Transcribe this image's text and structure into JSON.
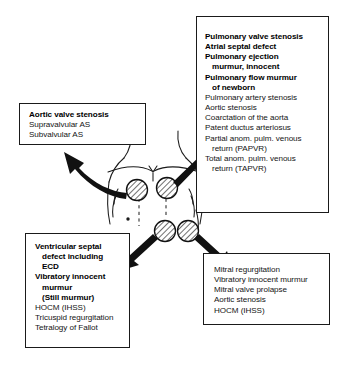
{
  "diagram": {
    "figure_name": "chest-auscultation-diagram"
  },
  "boxes": {
    "pulmonary": {
      "name": "pulmonary-area-box",
      "lines": [
        {
          "text": "Pulmonary valve stenosis",
          "bold": true,
          "indent": false
        },
        {
          "text": "Atrial septal defect",
          "bold": true,
          "indent": false
        },
        {
          "text": "Pulmonary ejection",
          "bold": true,
          "indent": false
        },
        {
          "text": "murmur, innocent",
          "bold": true,
          "indent": true
        },
        {
          "text": "Pulmonary flow murmur",
          "bold": true,
          "indent": false
        },
        {
          "text": "of newborn",
          "bold": true,
          "indent": true
        },
        {
          "text": "Pulmonary artery stenosis",
          "bold": false,
          "indent": false
        },
        {
          "text": "Aortic stenosis",
          "bold": false,
          "indent": false
        },
        {
          "text": "Coarctation of the aorta",
          "bold": false,
          "indent": false
        },
        {
          "text": "Patent ductus arteriosus",
          "bold": false,
          "indent": false
        },
        {
          "text": "Partial anom. pulm. venous",
          "bold": false,
          "indent": false
        },
        {
          "text": "return (PAPVR)",
          "bold": false,
          "indent": true
        },
        {
          "text": "Total anom. pulm. venous",
          "bold": false,
          "indent": false
        },
        {
          "text": "return (TAPVR)",
          "bold": false,
          "indent": true
        }
      ]
    },
    "aortic": {
      "name": "aortic-area-box",
      "lines": [
        {
          "text": "Aortic valve stenosis",
          "bold": true,
          "indent": false
        },
        {
          "text": "Supravalvular AS",
          "bold": false,
          "indent": false
        },
        {
          "text": "Subvalvular AS",
          "bold": false,
          "indent": false
        }
      ]
    },
    "vsd": {
      "name": "lower-left-sternal-border-box",
      "lines": [
        {
          "text": "Ventricular septal",
          "bold": true,
          "indent": false
        },
        {
          "text": "defect including",
          "bold": true,
          "indent": true
        },
        {
          "text": "ECD",
          "bold": true,
          "indent": true
        },
        {
          "text": "Vibratory innocent",
          "bold": true,
          "indent": false
        },
        {
          "text": "murmur",
          "bold": true,
          "indent": true
        },
        {
          "text": "(Still murmur)",
          "bold": true,
          "indent": true
        },
        {
          "text": "HOCM (IHSS)",
          "bold": false,
          "indent": false
        },
        {
          "text": "Tricuspid regurgitation",
          "bold": false,
          "indent": false
        },
        {
          "text": "Tetralogy of Fallot",
          "bold": false,
          "indent": false
        }
      ]
    },
    "mitral": {
      "name": "apex-area-box",
      "lines": [
        {
          "text": "Mitral regurgitation",
          "bold": false,
          "indent": false
        },
        {
          "text": "Vibratory innocent murmur",
          "bold": false,
          "indent": false
        },
        {
          "text": "Mitral valve prolapse",
          "bold": false,
          "indent": false
        },
        {
          "text": "Aortic stenosis",
          "bold": false,
          "indent": false
        },
        {
          "text": "HOCM (IHSS)",
          "bold": false,
          "indent": false
        }
      ]
    }
  },
  "colors": {
    "ink": "#141414",
    "border": "#1a1a1a",
    "background": "#ffffff"
  }
}
